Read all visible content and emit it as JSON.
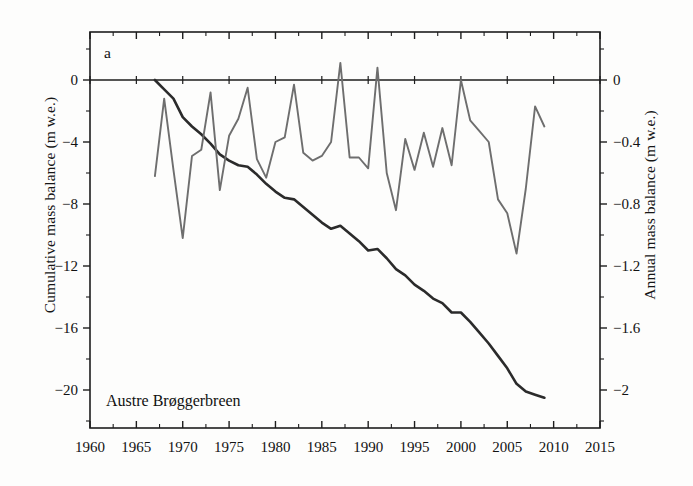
{
  "figure": {
    "panel_letter": "a",
    "glacier_name": "Austre Brøggerbreen"
  },
  "chart_data": {
    "type": "line",
    "title": "",
    "panel_label": "a",
    "annotation": "Austre Brøggerbreen",
    "xlabel": "",
    "xlim": [
      1960,
      2015
    ],
    "xticks": [
      1960,
      1965,
      1970,
      1975,
      1980,
      1985,
      1990,
      1995,
      2000,
      2005,
      2010,
      2015
    ],
    "xtick_labels": [
      "1960",
      "1965",
      "1970",
      "1975",
      "1980",
      "1985",
      "1990",
      "1995",
      "2000",
      "2005",
      "2010",
      "2015"
    ],
    "x_minor_tick_interval": 2.5,
    "grid": false,
    "legend": "none",
    "left_axis": {
      "label": "Cumulative mass balance (m w.e.)",
      "ylim": [
        -22,
        1.5
      ],
      "yticks": [
        0,
        -4,
        -8,
        -12,
        -16,
        -20
      ],
      "ytick_labels": [
        "0",
        "−4",
        "−8",
        "−12",
        "−16",
        "−20"
      ],
      "minor_tick_interval": 2
    },
    "right_axis": {
      "label": "Annual mass balance (m w.e.)",
      "ylim": [
        -2.2,
        0.15
      ],
      "yticks": [
        0,
        -0.4,
        -0.8,
        -1.2,
        -1.6,
        -2
      ],
      "ytick_labels": [
        "0",
        "−0.4",
        "−0.8",
        "−1.2",
        "−1.6",
        "−2"
      ],
      "minor_tick_interval": 0.2
    },
    "series": [
      {
        "name": "Cumulative mass balance",
        "axis": "left",
        "color": "#2b2b2b",
        "x": [
          1967,
          1968,
          1969,
          1970,
          1971,
          1972,
          1973,
          1974,
          1975,
          1976,
          1977,
          1978,
          1979,
          1980,
          1981,
          1982,
          1983,
          1984,
          1985,
          1986,
          1987,
          1988,
          1989,
          1990,
          1991,
          1992,
          1993,
          1994,
          1995,
          1996,
          1997,
          1998,
          1999,
          2000,
          2001,
          2002,
          2003,
          2004,
          2005,
          2006,
          2007,
          2008,
          2009
        ],
        "values": [
          0.0,
          -0.6,
          -1.2,
          -2.4,
          -3.0,
          -3.5,
          -4.1,
          -4.8,
          -5.2,
          -5.5,
          -5.6,
          -6.1,
          -6.7,
          -7.2,
          -7.6,
          -7.7,
          -8.2,
          -8.7,
          -9.2,
          -9.6,
          -9.4,
          -9.9,
          -10.4,
          -11.0,
          -10.9,
          -11.5,
          -12.2,
          -12.6,
          -13.2,
          -13.6,
          -14.1,
          -14.4,
          -15.0,
          -15.0,
          -15.6,
          -16.3,
          -17.0,
          -17.8,
          -18.6,
          -19.6,
          -20.1,
          -20.3,
          -20.5
        ]
      },
      {
        "name": "Annual mass balance",
        "axis": "right",
        "color": "#6e6e6e",
        "x": [
          1967,
          1968,
          1969,
          1970,
          1971,
          1972,
          1973,
          1974,
          1975,
          1976,
          1977,
          1978,
          1979,
          1980,
          1981,
          1982,
          1983,
          1984,
          1985,
          1986,
          1987,
          1988,
          1989,
          1990,
          1991,
          1992,
          1993,
          1994,
          1995,
          1996,
          1997,
          1998,
          1999,
          2000,
          2001,
          2002,
          2003,
          2004,
          2005,
          2006,
          2007,
          2008,
          2009
        ],
        "values": [
          -0.62,
          -0.12,
          -0.58,
          -1.02,
          -0.49,
          -0.45,
          -0.08,
          -0.71,
          -0.36,
          -0.25,
          -0.05,
          -0.51,
          -0.63,
          -0.4,
          -0.37,
          -0.03,
          -0.47,
          -0.52,
          -0.49,
          -0.4,
          0.11,
          -0.5,
          -0.5,
          -0.57,
          0.08,
          -0.6,
          -0.84,
          -0.38,
          -0.58,
          -0.34,
          -0.56,
          -0.31,
          -0.55,
          0.0,
          -0.26,
          -0.33,
          -0.4,
          -0.77,
          -0.86,
          -1.12,
          -0.7,
          -0.17,
          -0.3
        ]
      }
    ]
  },
  "axes_text": {
    "left_title": "Cumulative mass balance (m w.e.)",
    "right_title": "Annual mass balance (m w.e.)",
    "left_ticks": [
      "0",
      "−4",
      "−8",
      "−12",
      "−16",
      "−20"
    ],
    "right_ticks": [
      "0",
      "−0.4",
      "−0.8",
      "−1.2",
      "−1.6",
      "−2"
    ],
    "x_ticks": [
      "1960",
      "1965",
      "1970",
      "1975",
      "1980",
      "1985",
      "1990",
      "1995",
      "2000",
      "2005",
      "2010",
      "2015"
    ]
  }
}
